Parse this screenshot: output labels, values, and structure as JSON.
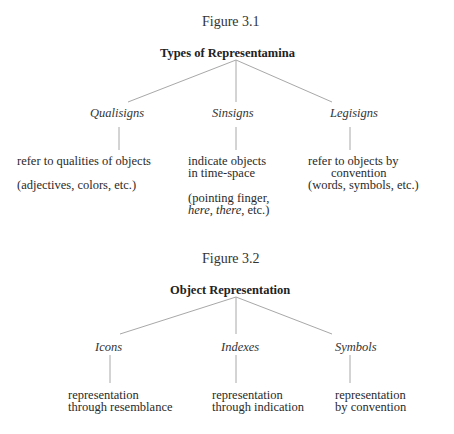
{
  "figures": [
    {
      "label": "Figure 3.1",
      "title": "Types of Representamina",
      "nodes": [
        {
          "name": "Qualisigns",
          "desc_lines": [
            "refer to qualities of objects"
          ],
          "example_lines": [
            "(adjectives, colors, etc.)"
          ]
        },
        {
          "name": "Sinsigns",
          "desc_lines": [
            "indicate objects",
            "in time-space"
          ],
          "example_lines": [
            "(pointing finger,",
            "here, there, etc.)"
          ]
        },
        {
          "name": "Legisigns",
          "desc_lines": [
            "refer to objects by",
            "convention"
          ],
          "example_lines": [
            "(words, symbols, etc.)"
          ]
        }
      ]
    },
    {
      "label": "Figure 3.2",
      "title": "Object Representation",
      "nodes": [
        {
          "name": "Icons",
          "desc_lines": [
            "representation",
            "through resemblance"
          ]
        },
        {
          "name": "Indexes",
          "desc_lines": [
            "representation",
            "through indication"
          ]
        },
        {
          "name": "Symbols",
          "desc_lines": [
            "representation",
            "by convention"
          ]
        }
      ]
    }
  ],
  "colors": {
    "line": "#a8a8a8",
    "text": "#2a2a2a"
  }
}
